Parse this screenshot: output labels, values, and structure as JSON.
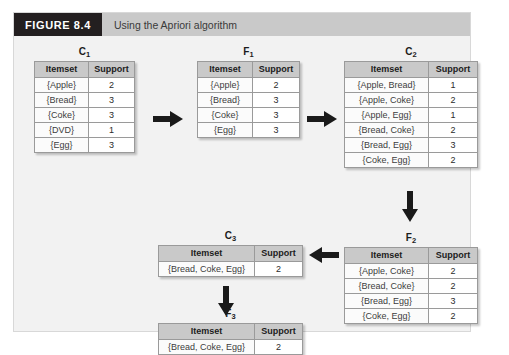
{
  "figure": {
    "number": "FIGURE 8.4",
    "title": "Using the Apriori algorithm"
  },
  "columns": {
    "itemset": "Itemset",
    "support": "Support"
  },
  "nodes": {
    "c1": {
      "label": "C",
      "sub": "1",
      "rows": [
        {
          "itemset": "{Apple}",
          "support": "2"
        },
        {
          "itemset": "{Bread}",
          "support": "3"
        },
        {
          "itemset": "{Coke}",
          "support": "3"
        },
        {
          "itemset": "{DVD}",
          "support": "1"
        },
        {
          "itemset": "{Egg}",
          "support": "3"
        }
      ]
    },
    "f1": {
      "label": "F",
      "sub": "1",
      "rows": [
        {
          "itemset": "{Apple}",
          "support": "2"
        },
        {
          "itemset": "{Bread}",
          "support": "3"
        },
        {
          "itemset": "{Coke}",
          "support": "3"
        },
        {
          "itemset": "{Egg}",
          "support": "3"
        }
      ]
    },
    "c2": {
      "label": "C",
      "sub": "2",
      "rows": [
        {
          "itemset": "{Apple, Bread}",
          "support": "1"
        },
        {
          "itemset": "{Apple, Coke}",
          "support": "2"
        },
        {
          "itemset": "{Apple, Egg}",
          "support": "1"
        },
        {
          "itemset": "{Bread, Coke}",
          "support": "2"
        },
        {
          "itemset": "{Bread, Egg}",
          "support": "3"
        },
        {
          "itemset": "{Coke, Egg}",
          "support": "2"
        }
      ]
    },
    "f2": {
      "label": "F",
      "sub": "2",
      "rows": [
        {
          "itemset": "{Apple, Coke}",
          "support": "2"
        },
        {
          "itemset": "{Bread, Coke}",
          "support": "2"
        },
        {
          "itemset": "{Bread, Egg}",
          "support": "3"
        },
        {
          "itemset": "{Coke, Egg}",
          "support": "2"
        }
      ]
    },
    "c3": {
      "label": "C",
      "sub": "3",
      "rows": [
        {
          "itemset": "{Bread, Coke, Egg}",
          "support": "2"
        }
      ]
    },
    "f3": {
      "label": "F",
      "sub": "3",
      "rows": [
        {
          "itemset": "{Bread, Coke, Egg}",
          "support": "2"
        }
      ]
    }
  },
  "arrows": {
    "c1_to_f1": "arrow-right-icon",
    "f1_to_c2": "arrow-right-icon",
    "c2_to_f2": "arrow-down-icon",
    "f2_to_c3": "arrow-left-icon",
    "c3_to_f3": "arrow-down-icon"
  },
  "colors": {
    "caption_number_bg": "#231f20",
    "caption_title_bg": "#c9c9c9",
    "panel_bg": "#f2f2f2",
    "table_header_bg": "#c9c9c9",
    "arrow": "#1a1a1a"
  }
}
